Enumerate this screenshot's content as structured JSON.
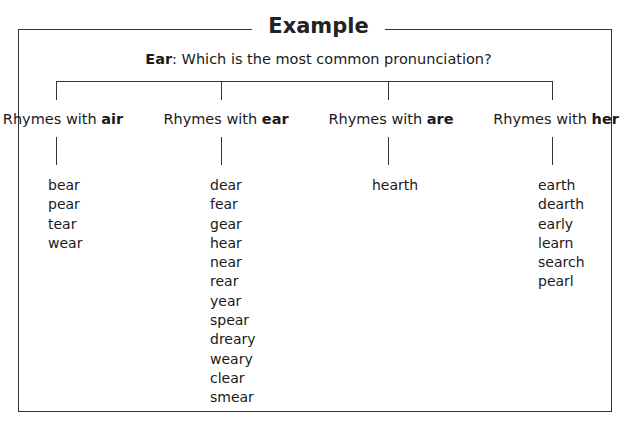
{
  "title": "Example",
  "question": {
    "word": "Ear",
    "text": ": Which is the most common pronunciation?"
  },
  "branches": [
    {
      "prefix": "Rhymes with ",
      "key": "air",
      "words": [
        "bear",
        "pear",
        "tear",
        "wear"
      ]
    },
    {
      "prefix": "Rhymes with ",
      "key": "ear",
      "words": [
        "dear",
        "fear",
        "gear",
        "hear",
        "near",
        "rear",
        "year",
        "spear",
        "dreary",
        "weary",
        "clear",
        "smear"
      ]
    },
    {
      "prefix": "Rhymes with ",
      "key": "are",
      "words": [
        "hearth"
      ]
    },
    {
      "prefix": "Rhymes with ",
      "key": "her",
      "words": [
        "earth",
        "dearth",
        "early",
        "learn",
        "search",
        "pearl"
      ]
    }
  ]
}
